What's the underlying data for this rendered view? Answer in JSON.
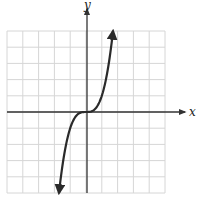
{
  "chart_data": {
    "type": "line",
    "title": "",
    "function": "y = x^3",
    "xlabel": "x",
    "ylabel": "y",
    "xlim": [
      -5,
      5
    ],
    "ylim": [
      -5,
      5
    ],
    "grid": true,
    "grid_cells": {
      "columns": 10,
      "rows": 10
    },
    "tick_labels": false,
    "series": [
      {
        "name": "y = x^3",
        "x": [
          -1.71,
          -1.5,
          -1.25,
          -1.0,
          -0.75,
          -0.5,
          -0.25,
          0,
          0.25,
          0.5,
          0.75,
          1.0,
          1.25,
          1.5,
          1.71
        ],
        "y": [
          -5.0,
          -3.375,
          -1.953,
          -1.0,
          -0.422,
          -0.125,
          -0.016,
          0,
          0.016,
          0.125,
          0.422,
          1.0,
          1.953,
          3.375,
          5.0
        ],
        "arrows_at_ends": true
      }
    ]
  },
  "labels": {
    "x_axis": "x",
    "y_axis": "y"
  },
  "colors": {
    "grid": "#d6d6d6",
    "axis": "#333333",
    "curve": "#2a2a2a",
    "background": "#ffffff"
  }
}
